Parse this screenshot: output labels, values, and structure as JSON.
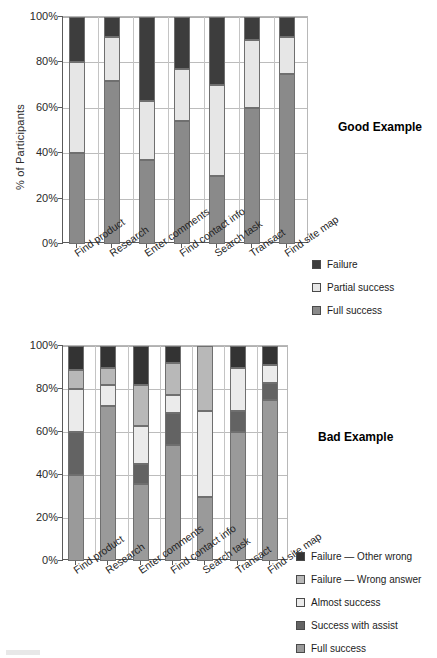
{
  "page": {
    "background": "#ffffff",
    "width": 437,
    "height": 658
  },
  "good_chart": {
    "title": "Good Example",
    "ylabel": "% of Participants",
    "yticks": [
      "0%",
      "20%",
      "40%",
      "60%",
      "80%",
      "100%"
    ],
    "categories": [
      "Find product",
      "Research",
      "Enter comments",
      "Find contact info",
      "Search task",
      "Transact",
      "Find site map"
    ],
    "legend": [
      {
        "label": "Failure",
        "color": "#3d3d3d"
      },
      {
        "label": "Partial success",
        "color": "#e6e6e6"
      },
      {
        "label": "Full success",
        "color": "#8a8a8a"
      }
    ]
  },
  "bad_chart": {
    "title": "Bad Example",
    "yticks": [
      "0%",
      "20%",
      "40%",
      "60%",
      "80%",
      "100%"
    ],
    "categories": [
      "Find product",
      "Research",
      "Enter comments",
      "Find contact info",
      "Search task",
      "Transact",
      "Find site map"
    ],
    "legend": [
      {
        "label": "Failure — Other wrong",
        "color": "#333333"
      },
      {
        "label": "Failure — Wrong answer",
        "color": "#b8b8b8"
      },
      {
        "label": "Almost success",
        "color": "#ebebeb"
      },
      {
        "label": "Success with assist",
        "color": "#636363"
      },
      {
        "label": "Full success",
        "color": "#9a9a9a"
      }
    ]
  },
  "chart_data": [
    {
      "id": "good_example",
      "type": "bar",
      "subtype": "stacked-100-percent",
      "title": "Good Example",
      "xlabel": "",
      "ylabel": "% of Participants",
      "ylim": [
        0,
        100
      ],
      "yticks": [
        0,
        20,
        40,
        60,
        80,
        100
      ],
      "grid": true,
      "legend_position": "right-below",
      "categories": [
        "Find product",
        "Research",
        "Enter comments",
        "Find contact info",
        "Search task",
        "Transact",
        "Find site map"
      ],
      "series": [
        {
          "name": "Full success",
          "color": "#8a8a8a",
          "values": [
            40,
            72,
            37,
            54,
            30,
            60,
            75
          ]
        },
        {
          "name": "Partial success",
          "color": "#e6e6e6",
          "values": [
            40,
            19,
            26,
            23,
            40,
            30,
            16
          ]
        },
        {
          "name": "Failure",
          "color": "#3d3d3d",
          "values": [
            20,
            9,
            37,
            23,
            30,
            10,
            9
          ]
        }
      ]
    },
    {
      "id": "bad_example",
      "type": "bar",
      "subtype": "stacked-100-percent",
      "title": "Bad Example",
      "xlabel": "",
      "ylabel": "",
      "ylim": [
        0,
        100
      ],
      "yticks": [
        0,
        20,
        40,
        60,
        80,
        100
      ],
      "grid": true,
      "legend_position": "right-below",
      "categories": [
        "Find product",
        "Research",
        "Enter comments",
        "Find contact info",
        "Search task",
        "Transact",
        "Find site map"
      ],
      "series": [
        {
          "name": "Full success",
          "color": "#9a9a9a",
          "values": [
            40,
            72,
            36,
            54,
            30,
            60,
            75
          ]
        },
        {
          "name": "Success with assist",
          "color": "#636363",
          "values": [
            20,
            0,
            9,
            15,
            0,
            10,
            8
          ]
        },
        {
          "name": "Almost success",
          "color": "#ebebeb",
          "values": [
            20,
            10,
            18,
            8,
            40,
            20,
            8
          ]
        },
        {
          "name": "Failure — Wrong answer",
          "color": "#b8b8b8",
          "values": [
            9,
            8,
            19,
            15,
            30,
            0,
            0
          ]
        },
        {
          "name": "Failure — Other wrong",
          "color": "#333333",
          "values": [
            11,
            10,
            18,
            8,
            0,
            10,
            9
          ]
        }
      ]
    }
  ]
}
